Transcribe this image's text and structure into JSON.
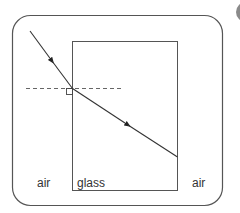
{
  "diagram": {
    "labels": {
      "left_medium": "air",
      "block_medium": "glass",
      "right_medium": "air"
    },
    "elements": {
      "frame": "rounded-border",
      "block": "glass-rectangle",
      "incident_ray": "ray entering glass with arrow",
      "normal": "dashed normal line",
      "right_angle_marker": "square at point of incidence",
      "refracted_ray": "ray inside glass bending toward normal with arrow"
    },
    "colors": {
      "line": "#333333",
      "frame": "#555555",
      "block": "#555555",
      "dashed": "#666666",
      "corner_badge": "#8a8a8a"
    }
  }
}
